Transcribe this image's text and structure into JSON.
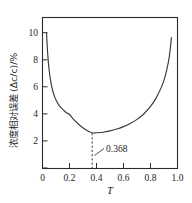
{
  "chart_data": {
    "type": "line",
    "title": "",
    "xlabel": "T",
    "ylabel": "浓度相对误差(Δc/c)/%",
    "ylabel_cn": "浓度相对误差",
    "ylabel_formula": "(Δc/c)/%",
    "xlim": [
      0,
      1.0
    ],
    "ylim": [
      0,
      11.2
    ],
    "grid": false,
    "legend": null,
    "xticks": [
      0,
      0.2,
      0.4,
      0.6,
      0.8,
      1.0
    ],
    "xtick_labels": [
      "0",
      "0.2",
      "0.4",
      "0.6",
      "0.8",
      "1.0"
    ],
    "yticks": [
      2,
      4,
      6,
      8,
      10
    ],
    "ytick_labels": [
      "2",
      "4",
      "6",
      "8",
      "10"
    ],
    "annotations": [
      {
        "label": "0.368",
        "x": 0.368,
        "y": 2.6,
        "kind": "minimum-marker",
        "marker": "dashed-vertical-line"
      }
    ],
    "series": [
      {
        "name": "relative concentration error",
        "x": [
          0.03,
          0.035,
          0.04,
          0.045,
          0.05,
          0.06,
          0.07,
          0.08,
          0.09,
          0.1,
          0.12,
          0.14,
          0.16,
          0.18,
          0.2,
          0.24,
          0.28,
          0.32,
          0.368,
          0.4,
          0.45,
          0.5,
          0.55,
          0.6,
          0.65,
          0.7,
          0.75,
          0.8,
          0.84,
          0.88,
          0.9,
          0.92,
          0.94,
          0.955
        ],
        "y": [
          10.05,
          9.05,
          8.3,
          7.7,
          7.22,
          6.5,
          5.98,
          5.6,
          5.3,
          5.06,
          4.7,
          4.45,
          4.26,
          4.1,
          3.98,
          3.52,
          3.14,
          2.85,
          2.62,
          2.62,
          2.66,
          2.76,
          2.9,
          3.08,
          3.32,
          3.62,
          4.02,
          4.58,
          5.18,
          6.0,
          6.54,
          7.28,
          8.35,
          9.7
        ]
      }
    ]
  },
  "axes": {
    "x_tick_labels": [
      "0",
      "0.2",
      "0.4",
      "0.6",
      "0.8",
      "1.0"
    ],
    "y_tick_labels": [
      "2",
      "4",
      "6",
      "8",
      "10"
    ],
    "x_axis_title": "T",
    "y_axis_title": "浓度相对误差(Δc/c)/%"
  },
  "annotation": {
    "min_label": "0.368"
  },
  "colors": {
    "curve": "#3a3a3a",
    "axis": "#2b2b2b",
    "text": "#1d1d1d",
    "background": "#ffffff"
  }
}
